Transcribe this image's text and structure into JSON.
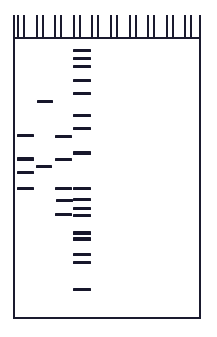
{
  "figure": {
    "name": "gel-electrophoresis-diagram",
    "type": "dna-gel",
    "caption": "",
    "gel": {
      "left": 13,
      "top": 15,
      "right": 201,
      "bottom": 319,
      "border_color": "#1a1a2e",
      "border_width": 2,
      "background": "#ffffff"
    },
    "comb": {
      "well_count": 10,
      "well_top": 15,
      "well_bottom": 39,
      "well_width": 8,
      "well_pitch": 18.6,
      "first_well_left": 17,
      "tooth_color": "#1a1a2e"
    }
  },
  "chart_data": {
    "type": "gel",
    "title": "",
    "xlabel": "",
    "ylabel": "",
    "lane_count": 10,
    "band_color": "#17172b",
    "lanes": [
      {
        "index": 1,
        "name": "lane-1",
        "x": 17,
        "width": 17,
        "bands": [
          {
            "y": 134,
            "height": 3,
            "x": 17,
            "width": 17
          },
          {
            "y": 157,
            "height": 4,
            "x": 17,
            "width": 17
          },
          {
            "y": 171,
            "height": 3,
            "x": 17,
            "width": 17
          },
          {
            "y": 187,
            "height": 3,
            "x": 17,
            "width": 17
          }
        ]
      },
      {
        "index": 2,
        "name": "lane-2",
        "x": 36,
        "width": 16,
        "bands": [
          {
            "y": 100,
            "height": 3,
            "x": 37,
            "width": 16
          },
          {
            "y": 165,
            "height": 3,
            "x": 36,
            "width": 16
          }
        ]
      },
      {
        "index": 3,
        "name": "lane-3",
        "x": 54,
        "width": 18,
        "bands": [
          {
            "y": 135,
            "height": 3,
            "x": 55,
            "width": 17
          },
          {
            "y": 158,
            "height": 3,
            "x": 55,
            "width": 17
          },
          {
            "y": 187,
            "height": 3,
            "x": 55,
            "width": 17
          },
          {
            "y": 199,
            "height": 3,
            "x": 56,
            "width": 17
          },
          {
            "y": 213,
            "height": 3,
            "x": 55,
            "width": 17
          }
        ]
      },
      {
        "index": 4,
        "name": "lane-4-ladder",
        "x": 73,
        "width": 18,
        "bands": [
          {
            "y": 49,
            "height": 3,
            "x": 73,
            "width": 18
          },
          {
            "y": 57,
            "height": 3,
            "x": 73,
            "width": 18
          },
          {
            "y": 65,
            "height": 3,
            "x": 73,
            "width": 18
          },
          {
            "y": 79,
            "height": 3,
            "x": 73,
            "width": 18
          },
          {
            "y": 92,
            "height": 3,
            "x": 73,
            "width": 18
          },
          {
            "y": 114,
            "height": 3,
            "x": 73,
            "width": 18
          },
          {
            "y": 127,
            "height": 3,
            "x": 73,
            "width": 18
          },
          {
            "y": 151,
            "height": 4,
            "x": 73,
            "width": 18
          },
          {
            "y": 187,
            "height": 3,
            "x": 73,
            "width": 18
          },
          {
            "y": 198,
            "height": 3,
            "x": 73,
            "width": 18
          },
          {
            "y": 207,
            "height": 3,
            "x": 73,
            "width": 18
          },
          {
            "y": 214,
            "height": 3,
            "x": 73,
            "width": 18
          },
          {
            "y": 231,
            "height": 4,
            "x": 73,
            "width": 18
          },
          {
            "y": 237,
            "height": 4,
            "x": 73,
            "width": 18
          },
          {
            "y": 253,
            "height": 3,
            "x": 73,
            "width": 18
          },
          {
            "y": 261,
            "height": 3,
            "x": 73,
            "width": 18
          },
          {
            "y": 288,
            "height": 3,
            "x": 73,
            "width": 18
          }
        ]
      },
      {
        "index": 5,
        "name": "lane-5",
        "x": 92,
        "width": 18,
        "bands": []
      },
      {
        "index": 6,
        "name": "lane-6",
        "x": 111,
        "width": 18,
        "bands": []
      },
      {
        "index": 7,
        "name": "lane-7",
        "x": 129,
        "width": 18,
        "bands": []
      },
      {
        "index": 8,
        "name": "lane-8",
        "x": 148,
        "width": 18,
        "bands": []
      },
      {
        "index": 9,
        "name": "lane-9",
        "x": 166,
        "width": 18,
        "bands": []
      },
      {
        "index": 10,
        "name": "lane-10",
        "x": 185,
        "width": 15,
        "bands": []
      }
    ]
  }
}
